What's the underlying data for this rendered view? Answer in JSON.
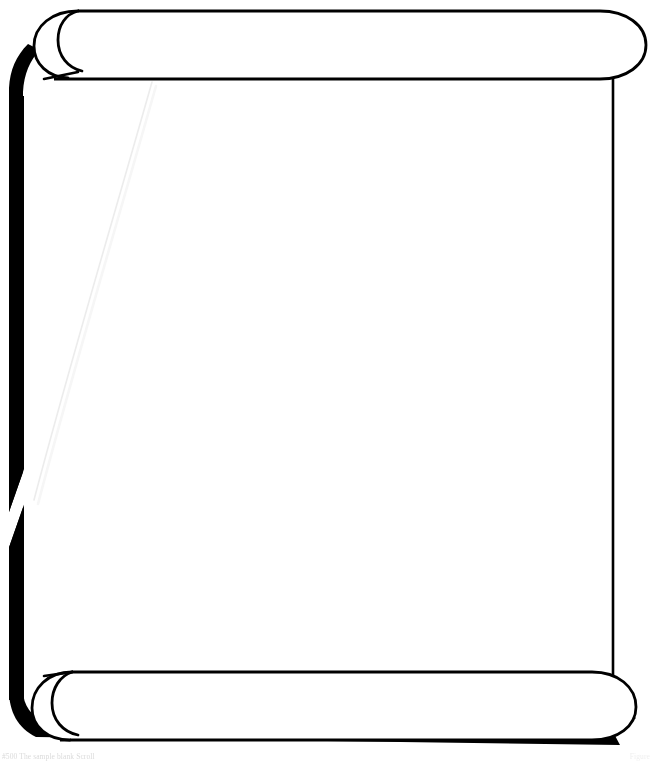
{
  "figure": {
    "kind": "line-art-illustration",
    "alt_text": "Blank scroll with curled top and bottom rolls and heavy black drop shadow",
    "width": 654,
    "height": 767
  },
  "colors": {
    "ink": "#000000",
    "paper": "#ffffff",
    "shadow": "#000000",
    "crease": "#f0f0f0",
    "caption": "#cfcfcf"
  },
  "parts": {
    "top_roll_label": "top roll",
    "bottom_roll_label": "bottom roll",
    "sheet_label": "scroll sheet",
    "left_shadow_label": "left drop shadow",
    "bottom_shadow_label": "bottom drop shadow",
    "crease_label": "diagonal fold crease",
    "notch_label": "shadow break notch"
  },
  "caption": {
    "left": "#500 The sample blank Scroll",
    "right": "Figure"
  }
}
